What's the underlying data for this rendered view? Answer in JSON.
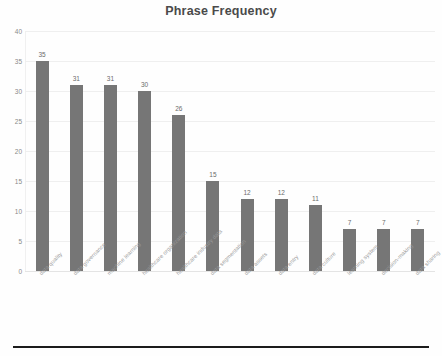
{
  "chart_data": {
    "type": "bar",
    "title": "Phrase Frequency",
    "xlabel": "",
    "ylabel": "",
    "ylim": [
      0,
      40
    ],
    "ytick_step": 5,
    "yticks": [
      40,
      35,
      30,
      25,
      20,
      15,
      10,
      5,
      0
    ],
    "grid": true,
    "legend": false,
    "bar_color": "#767676",
    "data_labels": true,
    "categories": [
      "data quality",
      "data governance",
      "machine learning",
      "healthcare organization",
      "healthcare industry data",
      "data segmentation",
      "data assets",
      "data entry",
      "data culture",
      "learning system",
      "decision-making",
      "data sharing"
    ],
    "values": [
      35,
      31,
      31,
      30,
      26,
      15,
      12,
      12,
      11,
      7,
      7,
      7
    ]
  }
}
